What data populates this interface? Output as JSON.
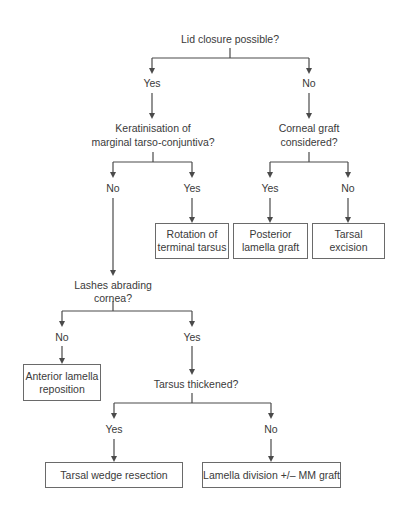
{
  "diagram": {
    "type": "decision-flowchart",
    "nodes": {
      "q_lid_closure": "Lid closure possible?",
      "lid_yes": "Yes",
      "lid_no": "No",
      "q_keratinisation_l1": "Keratinisation of",
      "q_keratinisation_l2": "marginal tarso-conjuntiva?",
      "q_corneal_l1": "Corneal graft",
      "q_corneal_l2": "considered?",
      "ker_no": "No",
      "ker_yes": "Yes",
      "corn_yes": "Yes",
      "corn_no": "No",
      "box_rotation_l1": "Rotation of",
      "box_rotation_l2": "terminal tarsus",
      "box_posterior_l1": "Posterior",
      "box_posterior_l2": "lamella graft",
      "box_tarsal_exc_l1": "Tarsal",
      "box_tarsal_exc_l2": "excision",
      "q_lashes_l1": "Lashes abrading",
      "q_lashes_l2": "cornea?",
      "lash_no": "No",
      "lash_yes": "Yes",
      "box_anterior_l1": "Anterior lamella",
      "box_anterior_l2": "reposition",
      "q_tarsus": "Tarsus thickened?",
      "tars_yes": "Yes",
      "tars_no": "No",
      "box_wedge": "Tarsal wedge resection",
      "box_lamella_div": "Lamella division +/– MM graft"
    },
    "edges": [
      [
        "Lid closure possible?",
        "Yes"
      ],
      [
        "Lid closure possible?",
        "No"
      ],
      [
        "Yes",
        "Keratinisation of marginal tarso-conjuntiva?"
      ],
      [
        "No",
        "Corneal graft considered?"
      ],
      [
        "Keratinisation",
        "No"
      ],
      [
        "Keratinisation",
        "Yes"
      ],
      [
        "Keratinisation:Yes",
        "Rotation of terminal tarsus"
      ],
      [
        "Keratinisation:No",
        "Lashes abrading cornea?"
      ],
      [
        "Corneal graft",
        "Yes"
      ],
      [
        "Corneal graft",
        "No"
      ],
      [
        "Corneal graft:Yes",
        "Posterior lamella graft"
      ],
      [
        "Corneal graft:No",
        "Tarsal excision"
      ],
      [
        "Lashes",
        "No"
      ],
      [
        "Lashes",
        "Yes"
      ],
      [
        "Lashes:No",
        "Anterior lamella reposition"
      ],
      [
        "Lashes:Yes",
        "Tarsus thickened?"
      ],
      [
        "Tarsus",
        "Yes"
      ],
      [
        "Tarsus",
        "No"
      ],
      [
        "Tarsus:Yes",
        "Tarsal wedge resection"
      ],
      [
        "Tarsus:No",
        "Lamella division +/– MM graft"
      ]
    ],
    "colors": {
      "line": "#4a4a4a",
      "text": "#3a3a3a",
      "box_border": "#6a6a6a",
      "background": "#ffffff"
    }
  }
}
